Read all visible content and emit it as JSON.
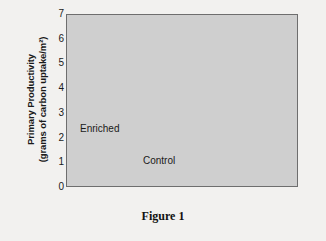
{
  "figure": {
    "caption": "Figure 1"
  },
  "chart_data": {
    "type": "line",
    "title": "",
    "xlabel": "",
    "ylabel": "Primary Productivity (grams of carbon uptake/m²)",
    "ylabel_line1": "Primary Productivity",
    "ylabel_line2": "(grams of carbon uptake/m²)",
    "xlim": [
      0,
      5
    ],
    "ylim": [
      0,
      7
    ],
    "grid": false,
    "legend_position": "inline-annotations",
    "plot_background": "#cfcfcf",
    "frame_color": "#6e6e6e",
    "categories": [
      "May",
      "June",
      "July",
      "August",
      "September"
    ],
    "xtick_labels": [
      "May",
      "June",
      "July",
      "August",
      "September"
    ],
    "ytick_labels": [
      "0",
      "1",
      "2",
      "3",
      "4",
      "5",
      "6",
      "7"
    ],
    "x_months": [
      "May",
      "June",
      "July",
      "August",
      "September"
    ],
    "series": [
      {
        "name": "Enriched",
        "color": "#1a1a1a",
        "width": 2.1,
        "x": [
          0.3,
          0.55,
          0.8,
          1.0,
          1.2,
          1.35,
          1.45,
          1.52,
          1.58,
          1.64,
          1.72,
          1.8,
          1.9,
          2.0,
          2.15,
          2.3,
          2.5,
          2.7,
          2.9,
          3.1,
          3.25,
          3.35,
          3.45,
          3.55,
          3.65,
          3.8,
          4.0,
          4.25,
          4.5,
          4.75,
          5.0
        ],
        "y": [
          1.15,
          1.22,
          1.4,
          1.62,
          2.0,
          2.45,
          2.95,
          3.55,
          4.25,
          4.9,
          5.2,
          5.28,
          5.28,
          5.32,
          5.6,
          5.85,
          6.05,
          6.15,
          6.18,
          6.18,
          6.17,
          6.14,
          6.05,
          5.8,
          5.3,
          4.55,
          3.8,
          3.05,
          2.5,
          2.05,
          1.65
        ]
      },
      {
        "name": "Control",
        "color": "#9a9a9a",
        "width": 2.1,
        "x": [
          0.3,
          0.6,
          0.9,
          1.15,
          1.4,
          1.65,
          1.9,
          2.1,
          2.3,
          2.5,
          2.7,
          2.85,
          3.0,
          3.15,
          3.3,
          3.5,
          3.7,
          3.9,
          4.1,
          4.25,
          4.35
        ],
        "y": [
          1.0,
          1.02,
          1.1,
          1.22,
          1.4,
          1.62,
          1.88,
          2.15,
          2.45,
          2.72,
          2.95,
          3.05,
          3.1,
          3.08,
          3.0,
          2.78,
          2.45,
          2.05,
          1.62,
          1.32,
          1.22
        ]
      }
    ],
    "annotations": [
      {
        "text": "Enriched",
        "series": "Enriched"
      },
      {
        "text": "Control",
        "series": "Control"
      }
    ]
  }
}
